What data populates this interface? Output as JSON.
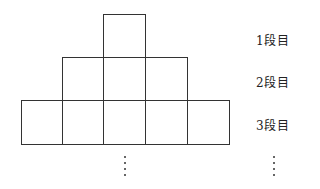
{
  "diagram": {
    "rows": [
      {
        "label": "1段目",
        "tiles": 1
      },
      {
        "label": "2段目",
        "tiles": 3
      },
      {
        "label": "3段目",
        "tiles": 5
      }
    ],
    "continuation": "⋮",
    "colors": {
      "line": "#333333",
      "background": "#ffffff"
    }
  }
}
